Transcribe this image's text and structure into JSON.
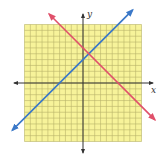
{
  "chart_data": {
    "type": "line",
    "title": "",
    "xlabel": "x",
    "ylabel": "y",
    "xlim": [
      -10,
      10
    ],
    "ylim": [
      -10,
      10
    ],
    "grid": true,
    "grid_step": 1,
    "legend": null,
    "series": [
      {
        "name": "blue line",
        "equation": "y = x + 4",
        "slope": 1,
        "intercept": 4,
        "color": "#3a78c8",
        "x": [
          -12.1,
          8.5
        ],
        "y": [
          -8.1,
          12.5
        ],
        "arrows": "both"
      },
      {
        "name": "red line",
        "equation": "y = -x + 6",
        "slope": -1,
        "intercept": 6,
        "color": "#e0506a",
        "x": [
          -5.8,
          12.3
        ],
        "y": [
          11.8,
          -6.3
        ],
        "arrows": "both"
      }
    ],
    "annotations": [
      {
        "type": "intersection",
        "x": 1,
        "y": 5
      }
    ]
  },
  "style": {
    "grid_fill": "#f7f39a",
    "grid_line": "#b8b36a",
    "axis_color": "#333333"
  },
  "labels": {
    "x_axis": "x",
    "y_axis": "y"
  }
}
